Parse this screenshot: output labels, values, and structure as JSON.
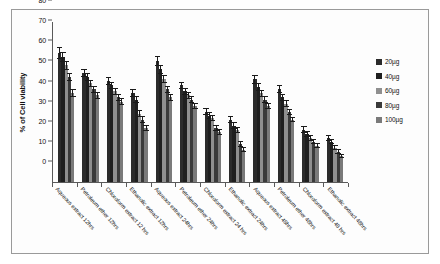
{
  "chart_data": {
    "type": "bar",
    "title": "",
    "xlabel": "",
    "ylabel": "% of Cell viability",
    "ylim": [
      0,
      80
    ],
    "yticks": [
      0,
      10,
      20,
      30,
      40,
      50,
      60,
      70,
      80
    ],
    "grid": false,
    "legend_position": "right",
    "categories": [
      "Aqueous extract 12hrs",
      "Petroleum ether 12hrs",
      "Chloroform extract 12 hrs",
      "Ethanolic extract 12hrs",
      "Aqueous extract 24hrs",
      "Petroleum ether 24hrs",
      "Chloroform extract 24 hrs",
      "Ethanolic extract 24hrs",
      "Aqueous extract 48hrs",
      "Petroleum ether 48hrs",
      "Chloroform extract 48 hrs",
      "Ethanolic extract 48hrs"
    ],
    "series": [
      {
        "name": "20µg",
        "color": "#2b2b2b",
        "values": [
          64,
          54,
          50,
          44,
          60,
          48,
          35,
          31,
          51,
          46,
          26,
          22
        ],
        "errors": [
          3.0,
          2.0,
          2.0,
          2.0,
          2.5,
          1.8,
          1.8,
          1.8,
          2.2,
          2.0,
          1.6,
          1.4
        ]
      },
      {
        "name": "40µg",
        "color": "#1f1f1f",
        "values": [
          62,
          52,
          48,
          41,
          56,
          45,
          33,
          28,
          47,
          42,
          24,
          20
        ],
        "errors": [
          2.5,
          2.0,
          1.8,
          1.8,
          2.2,
          1.8,
          1.6,
          1.6,
          2.0,
          1.8,
          1.5,
          1.3
        ]
      },
      {
        "name": "60µg",
        "color": "#8f8f8f",
        "values": [
          58,
          49,
          45,
          34,
          51,
          43,
          32,
          26,
          44,
          39,
          22,
          17
        ],
        "errors": [
          2.2,
          1.8,
          1.8,
          1.6,
          2.0,
          1.6,
          1.5,
          1.5,
          1.8,
          1.6,
          1.4,
          1.2
        ]
      },
      {
        "name": "80µg",
        "color": "#3a3a3a",
        "values": [
          52,
          46,
          42,
          31,
          46,
          41,
          27,
          19,
          41,
          35,
          20,
          15
        ],
        "errors": [
          2.0,
          1.8,
          1.6,
          1.6,
          1.8,
          1.6,
          1.5,
          1.4,
          1.6,
          1.5,
          1.3,
          1.2
        ]
      },
      {
        "name": "100µg",
        "color": "#7a7a7a",
        "values": [
          44,
          43,
          40,
          27,
          42,
          38,
          25,
          16,
          38,
          31,
          18,
          13
        ],
        "errors": [
          2.0,
          1.8,
          1.6,
          1.5,
          1.8,
          1.5,
          1.4,
          1.3,
          1.5,
          1.4,
          1.2,
          1.1
        ]
      }
    ]
  },
  "axis": {
    "y_label": "% of Cell viability"
  },
  "legend": {
    "items": [
      {
        "label": "20µg"
      },
      {
        "label": "40µg"
      },
      {
        "label": "60µg"
      },
      {
        "label": "80µg"
      },
      {
        "label": "100µg"
      }
    ]
  }
}
